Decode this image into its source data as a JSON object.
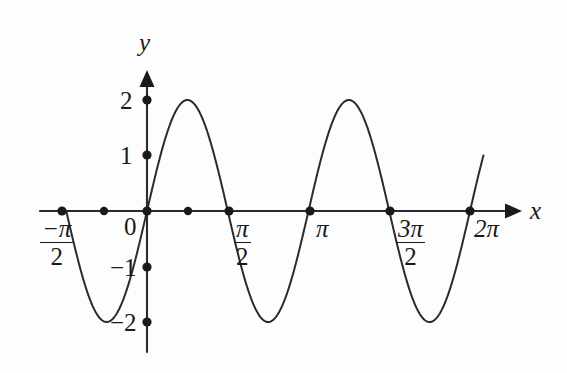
{
  "figure": {
    "kind": "cartesian-plot",
    "background_color": "#fdfdfd",
    "ink_color": "#1a1a1a"
  },
  "axes": {
    "x_axis_label": "x",
    "y_axis_label": "y",
    "x_axis_name": "x-axis",
    "y_axis_name": "y-axis"
  },
  "x_tick_labels": {
    "neg_half_pi_num": "−π",
    "neg_half_pi_den": "2",
    "origin": "0",
    "half_pi_num": "π",
    "half_pi_den": "2",
    "pi": "π",
    "three_half_pi_num": "3π",
    "three_half_pi_den": "2",
    "two_pi": "2π"
  },
  "y_tick_labels": {
    "two": "2",
    "one": "1",
    "neg_one": "−1",
    "neg_two": "−2"
  },
  "chart_data": {
    "type": "line",
    "title": "",
    "subtitle": "",
    "xlabel": "x",
    "ylabel": "y",
    "grid": false,
    "legend": false,
    "legend_position": "none",
    "function": "y = 2 sin(2x)",
    "amplitude": 2,
    "period": "π",
    "xlim": [
      -2.0,
      6.8
    ],
    "ylim": [
      -2.6,
      2.6
    ],
    "x_ticks": [
      -1.5708,
      0,
      1.5708,
      3.1416,
      4.7124,
      6.2832
    ],
    "x_tick_text": [
      "−π/2",
      "0",
      "π/2",
      "π",
      "3π/2",
      "2π"
    ],
    "y_ticks": [
      -2,
      -1,
      1,
      2
    ],
    "y_tick_text": [
      "−2",
      "−1",
      "1",
      "2"
    ],
    "marked_points_on_x_axis": [
      {
        "x": -1.5708,
        "y": 0,
        "label": "−π/2"
      },
      {
        "x": -0.7854,
        "y": 0,
        "label": ""
      },
      {
        "x": 0,
        "y": 0,
        "label": "0"
      },
      {
        "x": 0.7854,
        "y": 0,
        "label": ""
      },
      {
        "x": 1.5708,
        "y": 0,
        "label": "π/2"
      },
      {
        "x": 3.1416,
        "y": 0,
        "label": "π"
      },
      {
        "x": 4.7124,
        "y": 0,
        "label": "3π/2"
      },
      {
        "x": 6.2832,
        "y": 0,
        "label": "2π"
      }
    ],
    "marked_points_on_y_axis": [
      {
        "x": 0,
        "y": 2,
        "label": "2"
      },
      {
        "x": 0,
        "y": 1,
        "label": "1"
      },
      {
        "x": 0,
        "y": -1,
        "label": "−1"
      },
      {
        "x": 0,
        "y": -2,
        "label": "−2"
      }
    ],
    "extrema": [
      {
        "x": -0.7854,
        "y": -2,
        "type": "minimum"
      },
      {
        "x": 0.7854,
        "y": 2,
        "type": "maximum"
      },
      {
        "x": 2.3562,
        "y": -2,
        "type": "minimum"
      },
      {
        "x": 3.927,
        "y": 2,
        "type": "maximum"
      },
      {
        "x": 5.4978,
        "y": -2,
        "type": "minimum"
      }
    ],
    "series": [
      {
        "name": "y = 2 sin(2x)",
        "color": "#2b2b2b",
        "x": [
          -1.5708,
          -1.4399,
          -1.309,
          -1.1781,
          -1.0472,
          -0.9163,
          -0.7854,
          -0.6545,
          -0.5236,
          -0.3927,
          -0.2618,
          -0.1309,
          0.0,
          0.1309,
          0.2618,
          0.3927,
          0.5236,
          0.6545,
          0.7854,
          0.9163,
          1.0472,
          1.1781,
          1.309,
          1.4399,
          1.5708,
          1.7017,
          1.8326,
          1.9635,
          2.0944,
          2.2253,
          2.3562,
          2.4871,
          2.618,
          2.7489,
          2.8798,
          3.0107,
          3.1416,
          3.2725,
          3.4034,
          3.5343,
          3.6652,
          3.7961,
          3.927,
          4.0579,
          4.1888,
          4.3197,
          4.4506,
          4.5815,
          4.7124,
          4.8433,
          4.9742,
          5.1051,
          5.236,
          5.3669,
          5.4978,
          5.6287,
          5.7596,
          5.8905,
          6.0214,
          6.1523,
          6.2832,
          6.4141,
          6.545
        ],
        "y": [
          0.0,
          -0.5176,
          -1.0,
          -1.4142,
          -1.7321,
          -1.9319,
          -2.0,
          -1.9319,
          -1.7321,
          -1.4142,
          -1.0,
          -0.5176,
          0.0,
          0.5176,
          1.0,
          1.4142,
          1.7321,
          1.9319,
          2.0,
          1.9319,
          1.7321,
          1.4142,
          1.0,
          0.5176,
          0.0,
          -0.5176,
          -1.0,
          -1.4142,
          -1.7321,
          -1.9319,
          -2.0,
          -1.9319,
          -1.7321,
          -1.4142,
          -1.0,
          -0.5176,
          0.0,
          0.5176,
          1.0,
          1.4142,
          1.7321,
          1.9319,
          2.0,
          1.9319,
          1.7321,
          1.4142,
          1.0,
          0.5176,
          0.0,
          -0.5176,
          -1.0,
          -1.4142,
          -1.7321,
          -1.9319,
          -2.0,
          -1.9319,
          -1.7321,
          -1.4142,
          -1.0,
          -0.5176,
          0.0,
          0.5176,
          1.0
        ]
      }
    ]
  }
}
